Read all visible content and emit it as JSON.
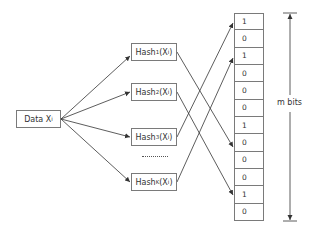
{
  "diagram": {
    "type": "bloom-filter",
    "data_node": {
      "label": "Data X",
      "subscript": "i"
    },
    "hash_nodes": [
      {
        "label": "Hash",
        "sub": "1",
        "arg": "(X",
        "arg_sub": "i",
        "close": ")"
      },
      {
        "label": "Hash",
        "sub": "2",
        "arg": "(X",
        "arg_sub": "i",
        "close": ")"
      },
      {
        "label": "Hash",
        "sub": "3",
        "arg": "(X",
        "arg_sub": "i",
        "close": ")"
      },
      {
        "label": "Hash",
        "sub": "K",
        "arg": "(X",
        "arg_sub": "i",
        "close": ")"
      }
    ],
    "ellipsis": "..........",
    "bit_array": [
      "1",
      "0",
      "1",
      "0",
      "0",
      "0",
      "1",
      "0",
      "0",
      "0",
      "1",
      "0"
    ],
    "bit_array_label": "m bits",
    "mappings": [
      {
        "from": "Hash1",
        "to_bit_index": 6
      },
      {
        "from": "Hash2",
        "to_bit_index": 10
      },
      {
        "from": "Hash3",
        "to_bit_index": 0
      },
      {
        "from": "HashK",
        "to_bit_index": 2
      }
    ],
    "colors": {
      "line": "#333333",
      "border": "#7a7a7a",
      "text": "#333333"
    }
  }
}
